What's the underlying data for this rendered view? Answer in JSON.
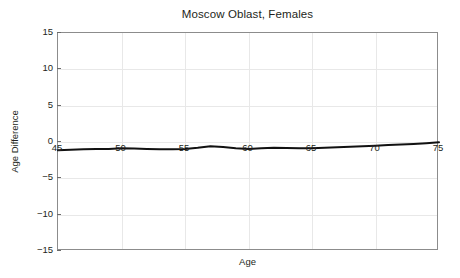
{
  "chart_data": {
    "type": "line",
    "title": "Moscow Oblast, Females",
    "xlabel": "Age",
    "ylabel": "Age Difference",
    "xlim": [
      45,
      75
    ],
    "ylim": [
      -15,
      15
    ],
    "xticks": [
      45,
      50,
      55,
      60,
      65,
      70,
      75
    ],
    "yticks": [
      15,
      10,
      5,
      0,
      -5,
      -10,
      -15
    ],
    "ytick_labels": [
      "15",
      "10",
      "5",
      "0",
      "-5",
      "-10",
      "-15"
    ],
    "xtick_labels": [
      "45",
      "50",
      "55",
      "60",
      "65",
      "70",
      "75"
    ],
    "grid": true,
    "legend": "none",
    "line_color": "#111111",
    "grid_color": "#e8e8e8",
    "frame_color": "#8c8c8c",
    "background": "#ffffff",
    "series": [
      {
        "name": "Age Difference",
        "x": [
          45,
          46,
          47,
          48,
          49,
          50,
          51,
          52,
          53,
          54,
          55,
          56,
          57,
          58,
          59,
          60,
          61,
          62,
          63,
          64,
          65,
          66,
          67,
          68,
          69,
          70,
          71,
          72,
          73,
          74,
          75
        ],
        "values": [
          -1.15,
          -1.08,
          -1.0,
          -0.98,
          -0.95,
          -0.85,
          -0.9,
          -0.95,
          -1.0,
          -1.0,
          -0.95,
          -0.8,
          -0.6,
          -0.7,
          -0.85,
          -0.95,
          -0.85,
          -0.8,
          -0.82,
          -0.85,
          -0.85,
          -0.8,
          -0.72,
          -0.65,
          -0.58,
          -0.5,
          -0.42,
          -0.34,
          -0.26,
          -0.16,
          -0.05
        ]
      }
    ]
  }
}
